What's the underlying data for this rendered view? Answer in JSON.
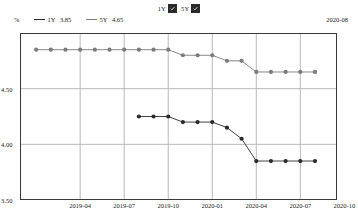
{
  "toggles": {
    "items": [
      {
        "label": "1Y",
        "checked": true,
        "icon": "checkbox-checked-icon"
      },
      {
        "label": "5Y",
        "checked": true,
        "icon": "checkbox-checked-icon"
      }
    ]
  },
  "legend": {
    "unit": "%",
    "as_of": "2020-08",
    "items": [
      {
        "name": "1Y",
        "value": "3.85",
        "color": "#2b2b2b"
      },
      {
        "name": "5Y",
        "value": "4.65",
        "color": "#7b7b7b"
      }
    ]
  },
  "chart_data": {
    "type": "line",
    "title": "",
    "xlabel": "",
    "ylabel": "%",
    "ylim": [
      3.5,
      5.0
    ],
    "yticks": [
      "4.50",
      "4.00",
      "3.50"
    ],
    "ytick_values": [
      4.5,
      4.0,
      3.5
    ],
    "grid": true,
    "legend_position": "top-left",
    "xticks": [
      "2019-04",
      "2019-07",
      "2019-10",
      "2020-01",
      "2020-04",
      "2020-07",
      "2020-10"
    ],
    "x": [
      "2019-01",
      "2019-02",
      "2019-03",
      "2019-04",
      "2019-05",
      "2019-06",
      "2019-07",
      "2019-08",
      "2019-09",
      "2019-10",
      "2019-11",
      "2019-12",
      "2020-01",
      "2020-02",
      "2020-03",
      "2020-04",
      "2020-05",
      "2020-06",
      "2020-07",
      "2020-08"
    ],
    "series": [
      {
        "name": "1Y",
        "color": "#2b2b2b",
        "values": [
          null,
          null,
          null,
          null,
          null,
          null,
          null,
          4.25,
          4.25,
          4.25,
          4.2,
          4.2,
          4.2,
          4.15,
          4.05,
          3.85,
          3.85,
          3.85,
          3.85,
          3.85
        ]
      },
      {
        "name": "5Y",
        "color": "#7b7b7b",
        "values": [
          4.85,
          4.85,
          4.85,
          4.85,
          4.85,
          4.85,
          4.85,
          4.85,
          4.85,
          4.85,
          4.8,
          4.8,
          4.8,
          4.75,
          4.75,
          4.65,
          4.65,
          4.65,
          4.65,
          4.65
        ]
      }
    ]
  }
}
